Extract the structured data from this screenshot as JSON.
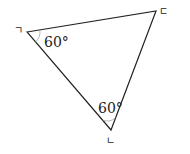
{
  "figure": {
    "type": "triangle",
    "stroke_color": "#222222",
    "angle_arc_color": "#999999",
    "vertices": [
      {
        "id": "A",
        "label": "ㄱ",
        "x": 27,
        "y": 32
      },
      {
        "id": "B",
        "label": "ㄴ",
        "x": 111,
        "y": 130
      },
      {
        "id": "C",
        "label": "ㄷ",
        "x": 156,
        "y": 11
      }
    ],
    "angles": [
      {
        "at": "ㄱ",
        "label": "60°"
      },
      {
        "at": "ㄴ",
        "label": "60°"
      }
    ]
  }
}
